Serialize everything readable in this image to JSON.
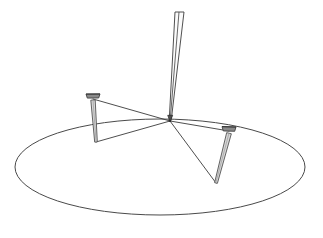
{
  "scene": {
    "title": "Line drawing of a pen tip and two nails on an elliptical plane",
    "background_color": "#ffffff",
    "width": 323,
    "height": 238,
    "line_color": "#3a3a3a",
    "ellipse_stroke_color": "#4a4a4a",
    "nail_shade_color": "#9b9b9b",
    "nail_head_color": "#6e6e6e",
    "pen_stroke_color": "#3c3c3c"
  },
  "ground": {
    "label": "elliptical ground plane",
    "cx": 160,
    "cy": 167,
    "rx": 145,
    "ry": 48,
    "stroke_width": 1.0
  },
  "pen": {
    "label": "pen",
    "tip_x": 170,
    "tip_y": 121,
    "top_left_x": 175,
    "top_left_y": 12,
    "top_right_x": 184,
    "top_right_y": 12,
    "center_top_x": 179,
    "center_top_y": 12,
    "stroke_width": 0.9
  },
  "nails": [
    {
      "name": "left-nail",
      "head_x": 93,
      "head_y": 97,
      "head_half_width": 7,
      "head_height": 3,
      "tip_x": 96,
      "tip_y": 142,
      "shaft_half_width": 2.2
    },
    {
      "name": "right-nail",
      "head_x": 229,
      "head_y": 130,
      "head_half_width": 7,
      "head_height": 3.2,
      "tip_x": 216,
      "tip_y": 183,
      "shaft_half_width": 2.4
    }
  ],
  "guide_lines": [
    {
      "name": "pen-tip-to-left-nail-head",
      "x1": 170,
      "y1": 121,
      "x2": 93,
      "y2": 99
    },
    {
      "name": "pen-tip-to-left-nail-tip",
      "x1": 170,
      "y1": 121,
      "x2": 96,
      "y2": 142
    },
    {
      "name": "pen-tip-to-right-nail-head",
      "x1": 170,
      "y1": 121,
      "x2": 229,
      "y2": 131
    },
    {
      "name": "pen-tip-to-right-nail-tip",
      "x1": 170,
      "y1": 121,
      "x2": 216,
      "y2": 183
    }
  ],
  "chart_data": {
    "type": "scatter",
    "xlabel": "",
    "ylabel": "",
    "grid": false,
    "legend": "none",
    "xlim": [
      0,
      323
    ],
    "ylim": [
      238,
      0
    ],
    "annotations": [
      "ellipse ground plane",
      "pen converging to a single contact point",
      "left nail standing upright",
      "right nail tilted toward the viewer",
      "sight lines from pen tip to each nail head and tip"
    ],
    "points": [
      {
        "label": "pen-tip",
        "x": 170,
        "y": 121
      },
      {
        "label": "pen-top",
        "x": 179,
        "y": 12
      },
      {
        "label": "left-nail-head",
        "x": 93,
        "y": 97
      },
      {
        "label": "left-nail-tip",
        "x": 96,
        "y": 142
      },
      {
        "label": "right-nail-head",
        "x": 229,
        "y": 130
      },
      {
        "label": "right-nail-tip",
        "x": 216,
        "y": 183
      },
      {
        "label": "ellipse-center",
        "x": 160,
        "y": 167
      },
      {
        "label": "ellipse-left",
        "x": 15,
        "y": 167
      },
      {
        "label": "ellipse-right",
        "x": 305,
        "y": 167
      },
      {
        "label": "ellipse-top",
        "x": 160,
        "y": 119
      },
      {
        "label": "ellipse-bottom",
        "x": 160,
        "y": 215
      }
    ]
  }
}
